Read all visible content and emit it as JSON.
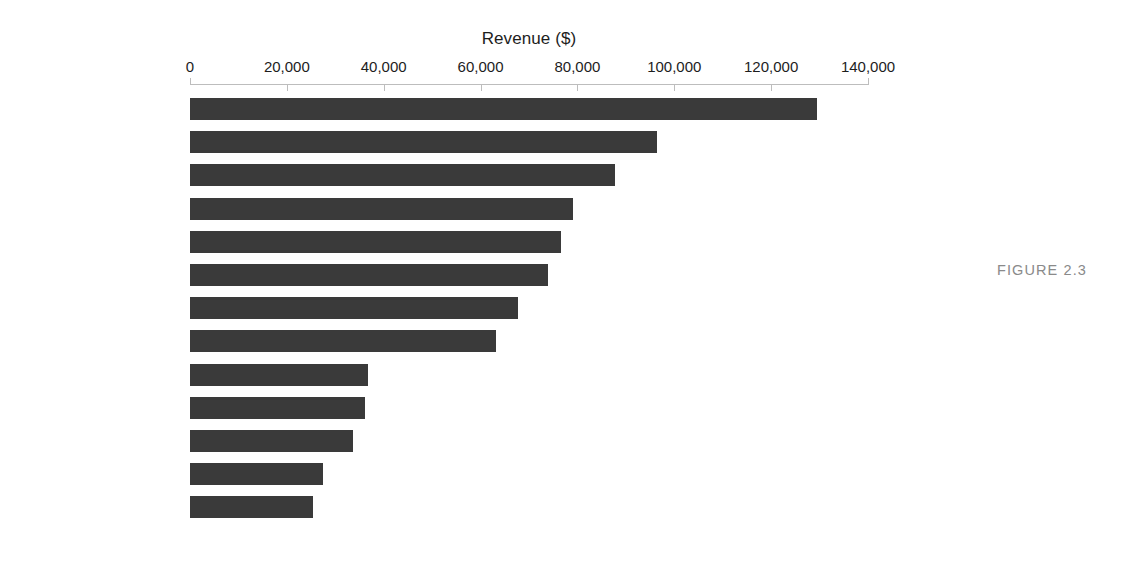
{
  "figure": {
    "caption": "FIGURE 2.3"
  },
  "chart_data": {
    "type": "bar",
    "orientation": "horizontal",
    "title": "",
    "xlabel": "Revenue ($)",
    "ylabel": "",
    "xlim": [
      0,
      140000
    ],
    "grid": false,
    "legend": null,
    "axis_title_position": "top",
    "tick_labels": [
      "0",
      "20,000",
      "40,000",
      "60,000",
      "80,000",
      "100,000",
      "120,000",
      "140,000"
    ],
    "ticks": [
      0,
      20000,
      40000,
      60000,
      80000,
      100000,
      120000,
      140000
    ],
    "bar_color": "#3a3a3a",
    "categories": [
      "Colombian",
      "Lemon",
      "Caffe Mocha",
      "Decaf Espresso",
      "Chamomile",
      "Darjeeling",
      "Earl Grey",
      "Decaf Irish Cream",
      "Caffe Latte",
      "Mint",
      "Green Tea",
      "Amaretto",
      "Regular Espresso"
    ],
    "values": [
      129500,
      96500,
      87800,
      79100,
      76600,
      73900,
      67700,
      63200,
      36700,
      36100,
      33700,
      27500,
      25400
    ]
  }
}
